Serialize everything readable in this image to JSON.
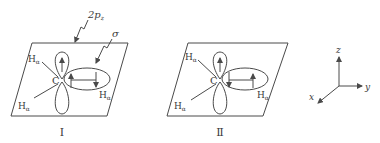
{
  "figure": {
    "diagram_1": {
      "caption": "Ⅰ",
      "label_2pz": "2p",
      "label_2pz_sub": "z",
      "label_sigma": "σ",
      "carbon": "C",
      "h_labels": [
        "H",
        "H",
        "H"
      ],
      "h_sub": "α",
      "pz_spin": "up",
      "sigma_spins": [
        "up",
        "down"
      ]
    },
    "diagram_2": {
      "caption": "Ⅱ",
      "carbon": "C",
      "h_labels": [
        "H",
        "H",
        "H"
      ],
      "h_sub": "α",
      "pz_spin": "up",
      "sigma_spins": [
        "down",
        "up"
      ]
    },
    "axes": {
      "z": "z",
      "y": "y",
      "x": "x"
    },
    "colors": {
      "line": "#4a4a4a",
      "text": "#3a3a3a",
      "background": "#ffffff"
    }
  }
}
